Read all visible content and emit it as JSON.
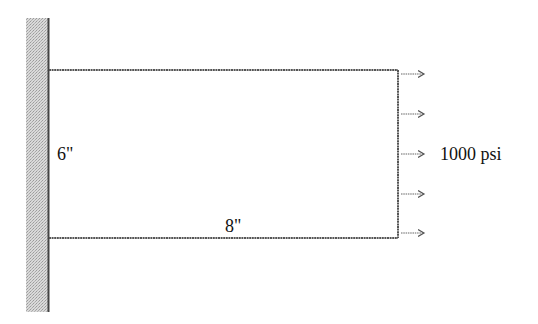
{
  "diagram": {
    "type": "cantilever plate under uniform tensile load",
    "support": {
      "kind": "fixed-wall",
      "side": "left"
    },
    "plate": {
      "height_label": "6\"",
      "width_label": "8\""
    },
    "load": {
      "label": "1000 psi",
      "direction": "right",
      "arrow_count": 5
    },
    "colors": {
      "line": "#444444",
      "hatch": "#bdbdbd",
      "text": "#111111"
    }
  }
}
